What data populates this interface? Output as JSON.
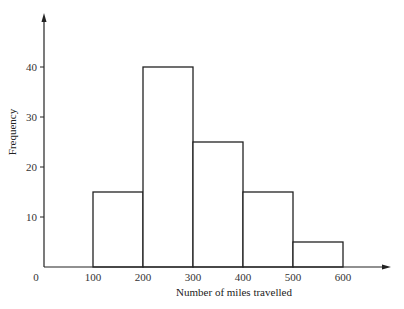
{
  "chart_data": {
    "type": "bar",
    "title": "",
    "xlabel": "Number of miles travelled",
    "ylabel": "Frequency",
    "categories": [
      "100-200",
      "200-300",
      "300-400",
      "400-500",
      "500-600"
    ],
    "bin_edges": [
      100,
      200,
      300,
      400,
      500,
      600
    ],
    "values": [
      15,
      40,
      25,
      15,
      5
    ],
    "x_ticks": [
      "0",
      "100",
      "200",
      "300",
      "400",
      "500",
      "600"
    ],
    "y_ticks": [
      "10",
      "20",
      "30",
      "40"
    ],
    "xlim": [
      0,
      700
    ],
    "ylim": [
      0,
      50
    ],
    "grid": false,
    "legend": null,
    "histogram": true
  },
  "colors": {
    "axis": "#222222",
    "bar_stroke": "#222222",
    "bar_fill": "#ffffff"
  }
}
